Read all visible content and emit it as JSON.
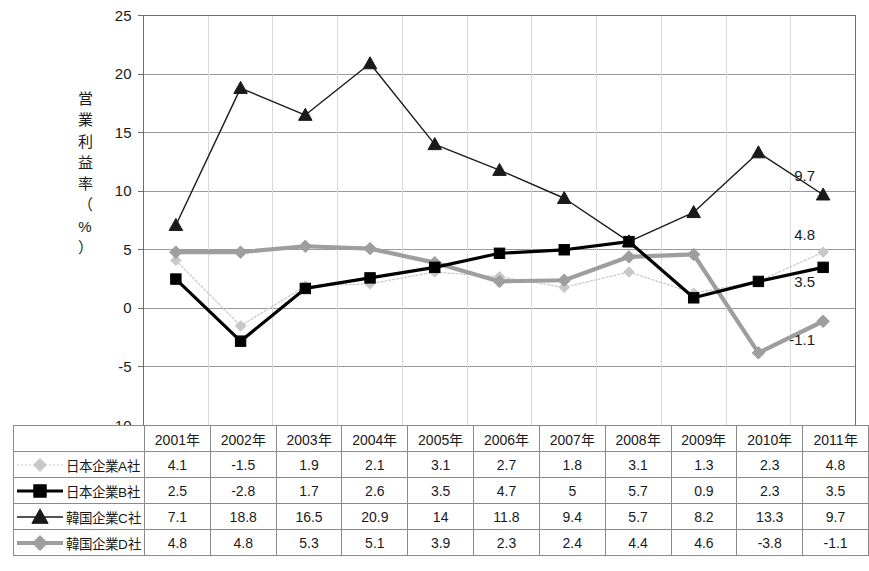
{
  "chart_data": {
    "type": "line",
    "title": "",
    "xlabel": "",
    "ylabel": "営業利益率（%）",
    "ylabel_chars": [
      "営",
      "業",
      "利",
      "益",
      "率",
      "（",
      "%",
      "）"
    ],
    "categories": [
      "2001年",
      "2002年",
      "2003年",
      "2004年",
      "2005年",
      "2006年",
      "2007年",
      "2008年",
      "2009年",
      "2010年",
      "2011年"
    ],
    "ylim": [
      -10,
      25
    ],
    "ytick_values": [
      -10,
      -5,
      0,
      5,
      10,
      15,
      20,
      25
    ],
    "ytick_labels": [
      "-10",
      "-5",
      "0",
      "5",
      "10",
      "15",
      "20",
      "25"
    ],
    "grid": true,
    "legend_position": "table-below",
    "series": [
      {
        "name": "日本企業A社",
        "key": "A",
        "color": "#c8c8c8",
        "marker": "diamond",
        "line_style": "dotted",
        "values": [
          4.1,
          -1.5,
          1.9,
          2.1,
          3.1,
          2.7,
          1.8,
          3.1,
          1.3,
          2.3,
          4.8
        ],
        "end_label": "4.8"
      },
      {
        "name": "日本企業B社",
        "key": "B",
        "color": "#000000",
        "marker": "square",
        "line_style": "solid",
        "values": [
          2.5,
          -2.8,
          1.7,
          2.6,
          3.5,
          4.7,
          5,
          5.7,
          0.9,
          2.3,
          3.5
        ],
        "end_label": "3.5"
      },
      {
        "name": "韓国企業C社",
        "key": "C",
        "color": "#1a1a1a",
        "marker": "triangle",
        "line_style": "solid",
        "values": [
          7.1,
          18.8,
          16.5,
          20.9,
          14,
          11.8,
          9.4,
          5.7,
          8.2,
          13.3,
          9.7
        ],
        "end_label": "9.7"
      },
      {
        "name": "韓国企業D社",
        "key": "D",
        "color": "#9e9e9e",
        "marker": "diamond",
        "line_style": "solid",
        "values": [
          4.8,
          4.8,
          5.3,
          5.1,
          3.9,
          2.3,
          2.4,
          4.4,
          4.6,
          -3.8,
          -1.1
        ],
        "end_label": "-1.1"
      }
    ],
    "data_labels": [
      "9.7",
      "4.8",
      "3.5",
      "-1.1"
    ]
  },
  "table": {
    "corner": "",
    "column_headers": [
      "2001年",
      "2002年",
      "2003年",
      "2004年",
      "2005年",
      "2006年",
      "2007年",
      "2008年",
      "2009年",
      "2010年",
      "2011年"
    ],
    "rows": [
      {
        "label": "日本企業A社",
        "cells": [
          "4.1",
          "-1.5",
          "1.9",
          "2.1",
          "3.1",
          "2.7",
          "1.8",
          "3.1",
          "1.3",
          "2.3",
          "4.8"
        ]
      },
      {
        "label": "日本企業B社",
        "cells": [
          "2.5",
          "-2.8",
          "1.7",
          "2.6",
          "3.5",
          "4.7",
          "5",
          "5.7",
          "0.9",
          "2.3",
          "3.5"
        ]
      },
      {
        "label": "韓国企業C社",
        "cells": [
          "7.1",
          "18.8",
          "16.5",
          "20.9",
          "14",
          "11.8",
          "9.4",
          "5.7",
          "8.2",
          "13.3",
          "9.7"
        ]
      },
      {
        "label": "韓国企業D社",
        "cells": [
          "4.8",
          "4.8",
          "5.3",
          "5.1",
          "3.9",
          "2.3",
          "2.4",
          "4.4",
          "4.6",
          "-3.8",
          "-1.1"
        ]
      }
    ]
  },
  "colors": {
    "axis": "#6e6e6e",
    "grid": "#9a9a9a",
    "border": "#8a8a8a",
    "series_a": "#c8c8c8",
    "series_b": "#000000",
    "series_c": "#1a1a1a",
    "series_d": "#9e9e9e",
    "text": "#1a1a1a",
    "background": "#ffffff"
  }
}
